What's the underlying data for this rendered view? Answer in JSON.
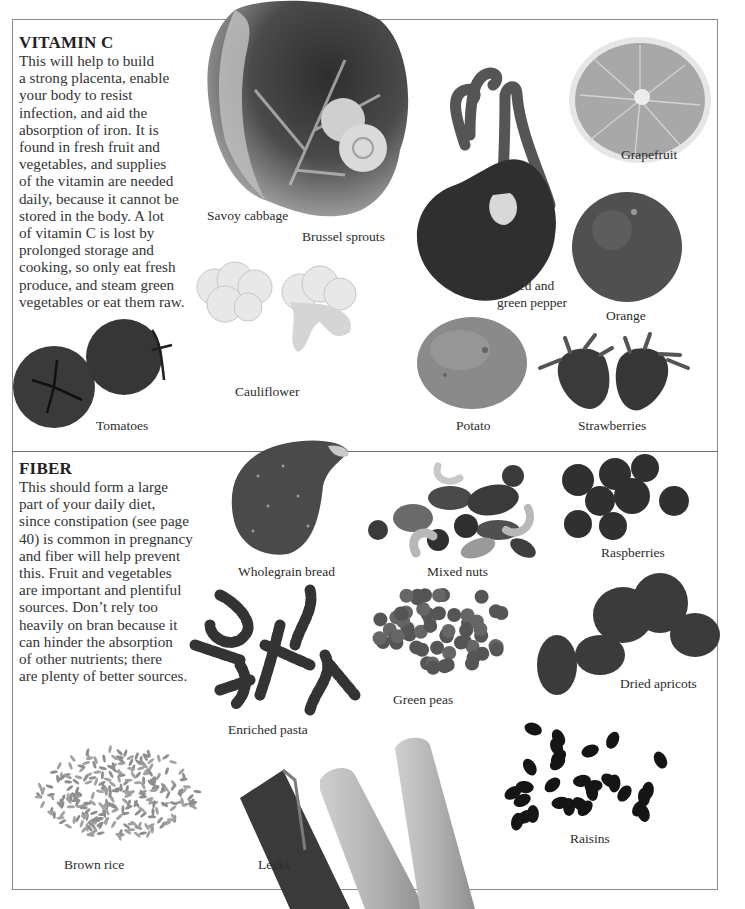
{
  "vitamin_c": {
    "title": "VITAMIN C",
    "text_lines": [
      "This will help to build",
      "a strong placenta, enable",
      "your body to resist",
      "infection, and aid the",
      "absorption of iron. It is",
      "found in fresh fruit and",
      "vegetables, and supplies",
      "of the vitamin are needed",
      "daily, because it cannot be",
      "stored in the body. A lot",
      "of vitamin C is lost by",
      "prolonged storage and",
      "cooking, so only eat fresh",
      "produce, and steam green",
      "vegetables or eat them raw."
    ],
    "foods": {
      "savoy_cabbage": "Savoy cabbage",
      "brussel_sprouts": "Brussel sprouts",
      "grapefruit": "Grapefruit",
      "pepper_line1": "Red and",
      "pepper_line2": "green pepper",
      "orange": "Orange",
      "cauliflower": "Cauliflower",
      "tomatoes": "Tomatoes",
      "potato": "Potato",
      "strawberries": "Strawberries"
    }
  },
  "fiber": {
    "title": "FIBER",
    "text_lines": [
      "This should form a large",
      "part of your daily diet,",
      "since constipation (see page",
      "40) is common in pregnancy",
      "and fiber will help prevent",
      "this. Fruit and vegetables",
      "are important and plentiful",
      "sources. Don’t rely too",
      "heavily on bran because it",
      "can hinder the absorption",
      "of other nutrients; there",
      "are plenty of better sources."
    ],
    "foods": {
      "wholegrain_bread": "Wholegrain bread",
      "mixed_nuts": "Mixed nuts",
      "raspberries": "Raspberries",
      "enriched_pasta": "Enriched pasta",
      "green_peas": "Green peas",
      "dried_apricots": "Dried apricots",
      "brown_rice": "Brown rice",
      "leeks": "Leeks",
      "raisins": "Raisins"
    }
  }
}
